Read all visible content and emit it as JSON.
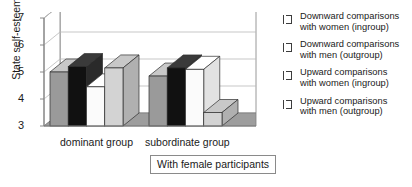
{
  "chart_data": {
    "type": "bar",
    "title": "",
    "subtitle": "",
    "xlabel": "",
    "ylabel": "State self-esteem",
    "ylim": [
      3,
      7
    ],
    "yticks": [
      3,
      4,
      5,
      6,
      7
    ],
    "grid": true,
    "three_d": true,
    "legend_position": "right",
    "categories": [
      "dominant group",
      "subordinate group"
    ],
    "series": [
      {
        "name": "Downward comparisons with women (ingroup)",
        "color": "#9a9a9a",
        "values": [
          5.0,
          4.85
        ]
      },
      {
        "name": "Downward comparisons with men (outgroup)",
        "color": "#111111",
        "values": [
          5.2,
          5.15
        ]
      },
      {
        "name": "Upward comparisons with women (ingroup)",
        "color": "#fbfbfb",
        "values": [
          4.45,
          5.1
        ]
      },
      {
        "name": "Upward comparisons with men (outgroup)",
        "color": "#d3d3d3",
        "values": [
          5.15,
          3.5
        ]
      }
    ],
    "annotations": [
      "With female participants"
    ]
  },
  "axis": {
    "y_title": "State self-esteem",
    "y_tick_labels": [
      "7",
      "6",
      "5",
      "4",
      "3"
    ],
    "x_tick_labels": [
      "dominant group",
      "subordinate group"
    ]
  },
  "caption": {
    "text": "With female participants"
  },
  "legend": {
    "entries": [
      {
        "line1": "Downward comparisons",
        "line2": "with women (ingroup)",
        "swatch": "medium-gray"
      },
      {
        "line1": "Downward comparisons",
        "line2": "with men (outgroup)",
        "swatch": "black"
      },
      {
        "line1": "Upward comparisons",
        "line2": "with women (ingroup)",
        "swatch": "white"
      },
      {
        "line1": "Upward comparisons",
        "line2": "with men (outgroup)",
        "swatch": "light-gray"
      }
    ]
  },
  "colors": {
    "series1": "#9a9a9a",
    "series2": "#111111",
    "series3": "#fbfbfb",
    "series4": "#d3d3d3",
    "axis": "#7d7d7d",
    "grid": "#b9b9b9",
    "floor": "#9d9d9d"
  }
}
